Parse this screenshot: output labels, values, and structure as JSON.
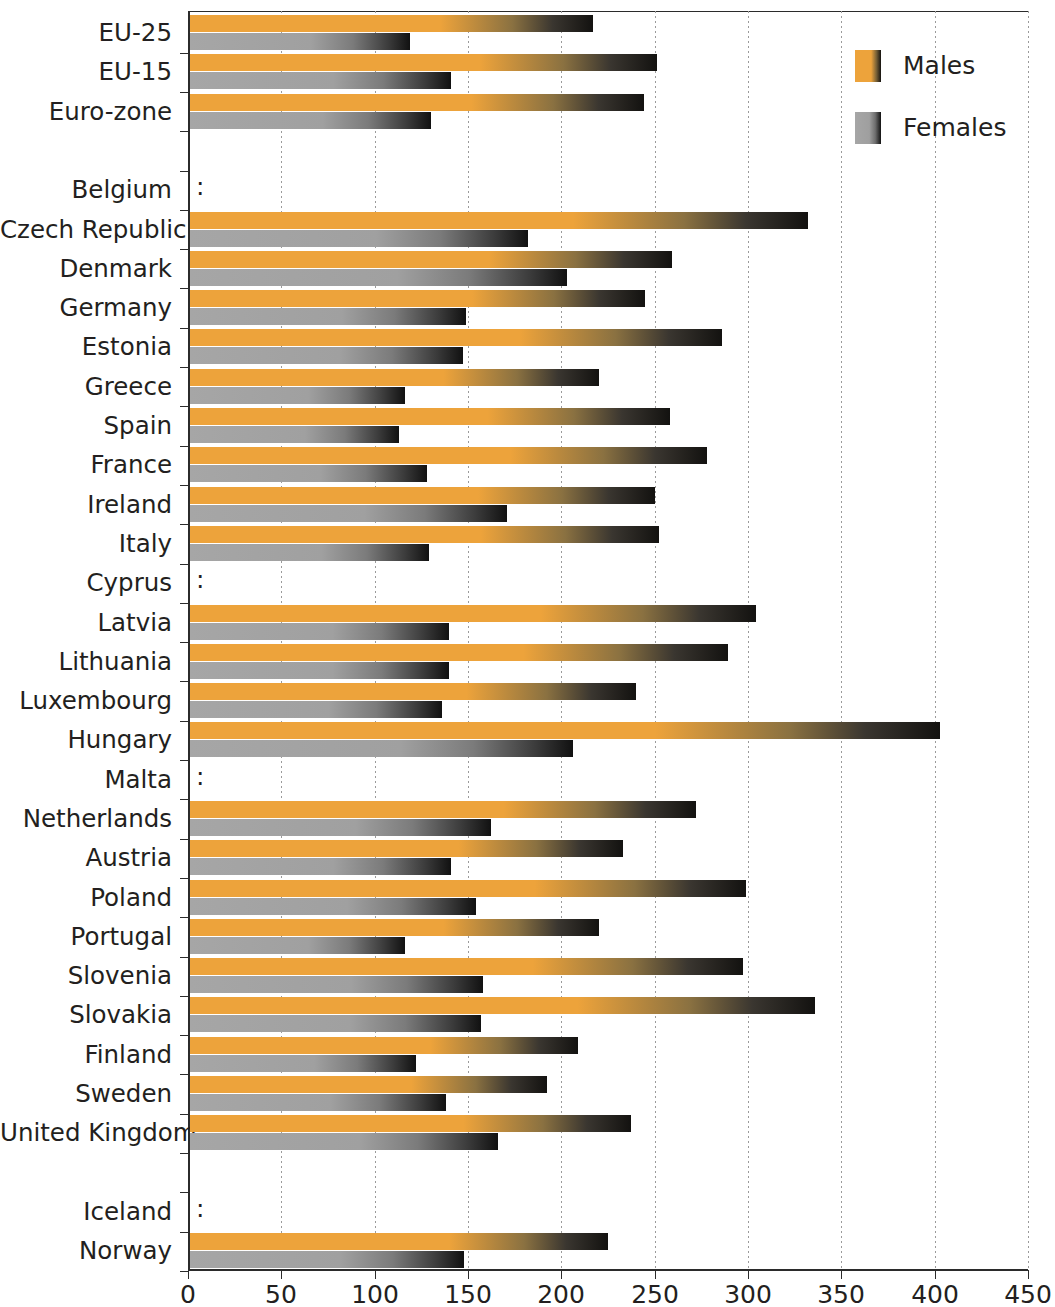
{
  "chart_data": {
    "type": "bar",
    "orientation": "horizontal",
    "title": "",
    "subtitle": "",
    "xlabel": "",
    "ylabel": "",
    "xlim": [
      0,
      450
    ],
    "xticks": [
      0,
      50,
      100,
      150,
      200,
      250,
      300,
      350,
      400,
      450
    ],
    "grid": true,
    "grid_axis": "x",
    "legend_position": "top-right",
    "no_data_marker": ":",
    "colors": {
      "males": "#eda33b",
      "females": "#a6a6a6",
      "shadow": "#131210",
      "axis": "#2b2b2b",
      "gridline": "#9a9a9a",
      "text": "#231f20",
      "background": "#ffffff"
    },
    "legend": [
      {
        "name": "Males",
        "color": "#eda33b",
        "icon": "legend-swatch-male"
      },
      {
        "name": "Females",
        "color": "#a6a6a6",
        "icon": "legend-swatch-female"
      }
    ],
    "series": [
      {
        "name": "Males",
        "color": "#eda33b"
      },
      {
        "name": "Females",
        "color": "#a6a6a6"
      }
    ],
    "categories": [
      "EU-25",
      "EU-15",
      "Euro-zone",
      "",
      "Belgium",
      "Czech Republic",
      "Denmark",
      "Germany",
      "Estonia",
      "Greece",
      "Spain",
      "France",
      "Ireland",
      "Italy",
      "Cyprus",
      "Latvia",
      "Lithuania",
      "Luxembourg",
      "Hungary",
      "Malta",
      "Netherlands",
      "Austria",
      "Poland",
      "Portugal",
      "Slovenia",
      "Slovakia",
      "Finland",
      "Sweden",
      "United Kingdom",
      "",
      "Iceland",
      "Norway"
    ],
    "rows": [
      {
        "label": "EU-25",
        "males": 216,
        "females": 118,
        "spacer": false
      },
      {
        "label": "EU-15",
        "males": 250,
        "females": 140,
        "spacer": false
      },
      {
        "label": "Euro-zone",
        "males": 243,
        "females": 129,
        "spacer": false
      },
      {
        "label": "",
        "males": null,
        "females": null,
        "spacer": true
      },
      {
        "label": "Belgium",
        "males": null,
        "females": null,
        "spacer": false
      },
      {
        "label": "Czech Republic",
        "males": 331,
        "females": 181,
        "spacer": false
      },
      {
        "label": "Denmark",
        "males": 258,
        "females": 202,
        "spacer": false
      },
      {
        "label": "Germany",
        "males": 244,
        "females": 148,
        "spacer": false
      },
      {
        "label": "Estonia",
        "males": 285,
        "females": 146,
        "spacer": false
      },
      {
        "label": "Greece",
        "males": 219,
        "females": 115,
        "spacer": false
      },
      {
        "label": "Spain",
        "males": 257,
        "females": 112,
        "spacer": false
      },
      {
        "label": "France",
        "males": 277,
        "females": 127,
        "spacer": false
      },
      {
        "label": "Ireland",
        "males": 249,
        "females": 170,
        "spacer": false
      },
      {
        "label": "Italy",
        "males": 251,
        "females": 128,
        "spacer": false
      },
      {
        "label": "Cyprus",
        "males": null,
        "females": null,
        "spacer": false
      },
      {
        "label": "Latvia",
        "males": 303,
        "females": 139,
        "spacer": false
      },
      {
        "label": "Lithuania",
        "males": 288,
        "females": 139,
        "spacer": false
      },
      {
        "label": "Luxembourg",
        "males": 239,
        "females": 135,
        "spacer": false
      },
      {
        "label": "Hungary",
        "males": 402,
        "females": 205,
        "spacer": false
      },
      {
        "label": "Malta",
        "males": null,
        "females": null,
        "spacer": false
      },
      {
        "label": "Netherlands",
        "males": 271,
        "females": 161,
        "spacer": false
      },
      {
        "label": "Austria",
        "males": 232,
        "females": 140,
        "spacer": false
      },
      {
        "label": "Poland",
        "males": 298,
        "females": 153,
        "spacer": false
      },
      {
        "label": "Portugal",
        "males": 219,
        "females": 115,
        "spacer": false
      },
      {
        "label": "Slovenia",
        "males": 296,
        "females": 157,
        "spacer": false
      },
      {
        "label": "Slovakia",
        "males": 335,
        "females": 156,
        "spacer": false
      },
      {
        "label": "Finland",
        "males": 208,
        "females": 121,
        "spacer": false
      },
      {
        "label": "Sweden",
        "males": 191,
        "females": 137,
        "spacer": false
      },
      {
        "label": "United Kingdom",
        "males": 236,
        "females": 165,
        "spacer": false
      },
      {
        "label": "",
        "males": null,
        "females": null,
        "spacer": true
      },
      {
        "label": "Iceland",
        "males": null,
        "females": null,
        "spacer": false
      },
      {
        "label": "Norway",
        "males": 224,
        "females": 147,
        "spacer": false
      }
    ]
  }
}
